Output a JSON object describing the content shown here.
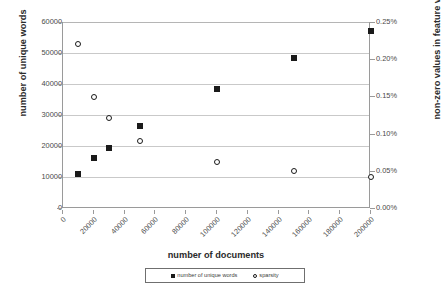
{
  "chart_data": {
    "type": "scatter",
    "title": "",
    "xlabel": "number of documents",
    "ylabel": "number of unique words",
    "ylabel_secondary": "non-zero values in feature vectors",
    "xlim": [
      0,
      200000
    ],
    "ylim": [
      0,
      60000
    ],
    "ylim_secondary": [
      0,
      0.25
    ],
    "xticks": [
      0,
      20000,
      40000,
      60000,
      80000,
      100000,
      120000,
      140000,
      160000,
      180000,
      200000
    ],
    "xticklabels": [
      "0",
      "20000",
      "40000",
      "60000",
      "80000",
      "100000",
      "120000",
      "140000",
      "160000",
      "180000",
      "200000"
    ],
    "yticks": [
      0,
      10000,
      20000,
      30000,
      40000,
      50000,
      60000
    ],
    "yticklabels": [
      "0",
      "10000",
      "20000",
      "30000",
      "40000",
      "50000",
      "60000"
    ],
    "yticks_secondary": [
      0,
      0.05,
      0.1,
      0.15,
      0.2,
      0.25
    ],
    "yticklabels_secondary": [
      "0.00%",
      "0.05%",
      "0.10%",
      "0.15%",
      "0.20%",
      "0.25%"
    ],
    "grid": true,
    "grid_axis": "y",
    "legend_position": "bottom",
    "series": [
      {
        "name": "number of unique words",
        "marker": "filled-square",
        "color": "#1a1a1a",
        "axis": "left",
        "x": [
          10000,
          20000,
          30000,
          50000,
          100000,
          150000,
          200000
        ],
        "values": [
          11000,
          16000,
          19500,
          26500,
          38500,
          48500,
          57000
        ]
      },
      {
        "name": "sparsity",
        "marker": "open-circle",
        "color": "#1a1a1a",
        "axis": "right",
        "x": [
          10000,
          20000,
          30000,
          50000,
          100000,
          150000,
          200000
        ],
        "values": [
          0.22,
          0.149,
          0.121,
          0.0905,
          0.0615,
          0.0495,
          0.0415
        ]
      }
    ]
  },
  "legend": {
    "entries": [
      {
        "label": "number of unique words"
      },
      {
        "label": "sparsity"
      }
    ]
  }
}
